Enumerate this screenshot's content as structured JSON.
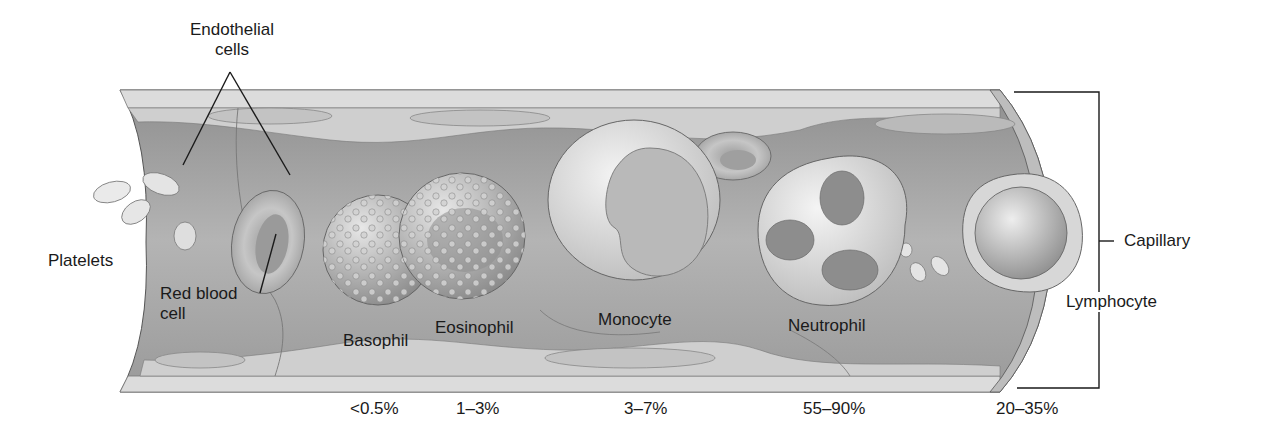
{
  "figure": {
    "labels": {
      "endothelial": [
        "Endothelial",
        "cells"
      ],
      "platelets": "Platelets",
      "red_blood_cell": [
        "Red blood",
        "cell"
      ],
      "basophil": "Basophil",
      "eosinophil": "Eosinophil",
      "monocyte": "Monocyte",
      "neutrophil": "Neutrophil",
      "lymphocyte": "Lymphocyte",
      "capillary": "Capillary"
    },
    "percentages": [
      {
        "cell": "Basophil",
        "value": "<0.5%"
      },
      {
        "cell": "Eosinophil",
        "value": "1–3%"
      },
      {
        "cell": "Monocyte",
        "value": "3–7%"
      },
      {
        "cell": "Neutrophil",
        "value": "55–90%"
      },
      {
        "cell": "Lymphocyte",
        "value": "20–35%"
      }
    ],
    "colors": {
      "wall_light": "#d9d9d9",
      "lumen": "#a9a9a9",
      "cell_light": "#e6e6e6",
      "nucleus": "#8c8c8c",
      "line": "#1a1a1a"
    }
  }
}
